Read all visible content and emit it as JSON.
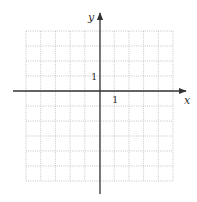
{
  "diagram": {
    "type": "coordinate-grid",
    "axes": {
      "x_label": "x",
      "y_label": "y",
      "x_unit_label": "1",
      "y_unit_label": "1"
    },
    "grid": {
      "columns": 10,
      "rows": 10,
      "x_range": [
        -5,
        5
      ],
      "y_range": [
        -4,
        6
      ],
      "line_style": "dotted",
      "line_color": "#b8b8b8"
    },
    "axis_color": "#333333"
  }
}
